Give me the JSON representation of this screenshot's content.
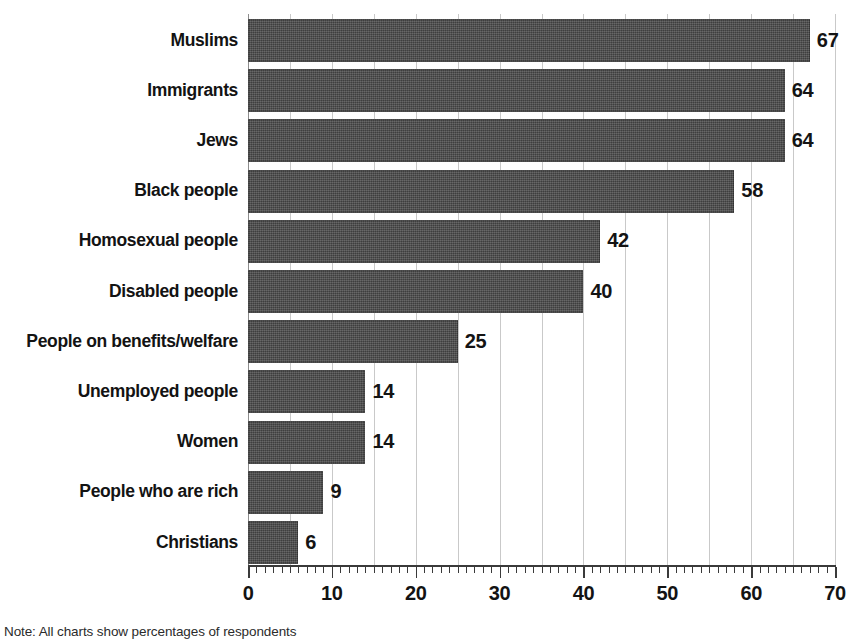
{
  "chart_data": {
    "type": "bar",
    "orientation": "horizontal",
    "title": "",
    "subtitle": "",
    "xlabel": "",
    "ylabel": "",
    "xlim": [
      0,
      70
    ],
    "ylim": null,
    "grid": true,
    "grid_axis": "x",
    "grid_interval": 5,
    "tick_interval_major": 10,
    "tick_interval_minor": 1,
    "legend_position": "none",
    "legend": [],
    "tick_labels": [
      "0",
      "10",
      "20",
      "30",
      "40",
      "50",
      "60",
      "70"
    ],
    "categories": [
      "Muslims",
      "Immigrants",
      "Jews",
      "Black people",
      "Homosexual people",
      "Disabled people",
      "People on benefits/welfare",
      "Unemployed people",
      "Women",
      "People who are rich",
      "Christians"
    ],
    "values": [
      67,
      64,
      64,
      58,
      42,
      40,
      25,
      14,
      14,
      9,
      6
    ],
    "data_labels": [
      "67",
      "64",
      "64",
      "58",
      "42",
      "40",
      "25",
      "14",
      "14",
      "9",
      "6"
    ],
    "series": [
      {
        "name": "",
        "values": [
          67,
          64,
          64,
          58,
          42,
          40,
          25,
          14,
          14,
          9,
          6
        ]
      }
    ],
    "annotations": []
  },
  "style": {
    "bar_color": "#4c4c4c",
    "grid_color": "#c9c9c9",
    "axis_color": "#3a3a3a",
    "text_color": "#131313",
    "background": "#ffffff"
  },
  "caption": {
    "text": "Note: All charts show percentages of respondents"
  }
}
